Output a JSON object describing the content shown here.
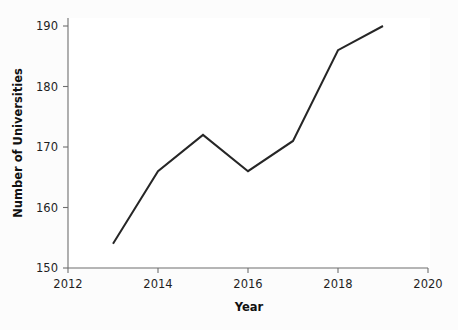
{
  "chart_data": {
    "type": "line",
    "title": "",
    "xlabel": "Year",
    "ylabel": "Number of Universities",
    "x": [
      2013,
      2014,
      2015,
      2016,
      2017,
      2018,
      2019
    ],
    "values": [
      154,
      166,
      172,
      166,
      171,
      186,
      190
    ],
    "series": [
      {
        "name": "Number of Universities",
        "values": [
          154,
          166,
          172,
          166,
          171,
          186,
          190
        ]
      }
    ],
    "xlim": [
      2012,
      2020
    ],
    "ylim": [
      150,
      190
    ],
    "xticks": [
      2012,
      2014,
      2016,
      2018,
      2020
    ],
    "xtick_labels": [
      "2012",
      "2014",
      "2016",
      "2018",
      "2020"
    ],
    "yticks": [
      150,
      160,
      170,
      180,
      190
    ],
    "ytick_labels": [
      "150",
      "160",
      "170",
      "180",
      "190"
    ],
    "grid": false,
    "legend": false,
    "legend_position": "none",
    "line_color": "#262626",
    "background_color": "#ffffff",
    "page_color": "#fcfcfc",
    "axis_color": "#6e6e6e",
    "markers": false,
    "spines": [
      "left",
      "bottom"
    ]
  },
  "axis": {
    "x_title": "Year",
    "y_title": "Number of Universities"
  }
}
